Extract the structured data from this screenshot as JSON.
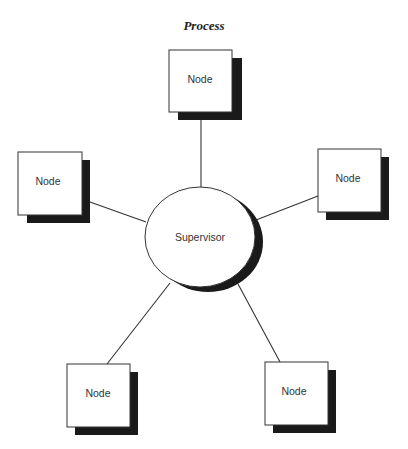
{
  "title": "Process",
  "center": {
    "label": "Supervisor"
  },
  "nodes": [
    {
      "id": "top",
      "label": "Node"
    },
    {
      "id": "left",
      "label": "Node"
    },
    {
      "id": "right",
      "label": "Node"
    },
    {
      "id": "bottom-left",
      "label": "Node"
    },
    {
      "id": "bottom-right",
      "label": "Node"
    }
  ],
  "colors": {
    "stroke": "#333333",
    "shadow": "#1a1a1a",
    "fill": "#ffffff"
  }
}
